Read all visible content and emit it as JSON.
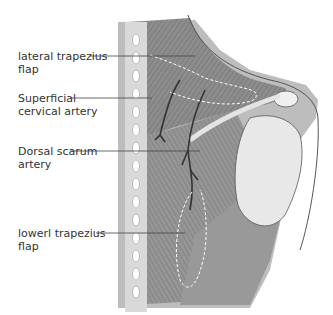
{
  "labels": [
    {
      "id": "lateral-trapezius-flap",
      "line1": "lateral trapezius",
      "line2": "flap"
    },
    {
      "id": "superficial-cervical-artery",
      "line1": "Superficial",
      "line2": "cervical artery"
    },
    {
      "id": "dorsal-scapular-artery",
      "line1": "Dorsal scarum",
      "line2": "artery"
    },
    {
      "id": "lower-trapezius-flap",
      "line1": "lowerl trapezius",
      "line2": "flap"
    }
  ],
  "colors": {
    "muscle": "#8a8a8a",
    "muscle_dark": "#6f6f6f",
    "bone": "#e6e6e6",
    "spine": "#d8d8d8",
    "artery": "#3a3a3a",
    "leader": "#444444",
    "dashed": "#ffffff"
  }
}
